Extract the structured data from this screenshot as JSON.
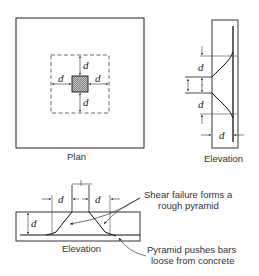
{
  "figure": {
    "plan": {
      "caption": "Plan",
      "dimension_labels": [
        "d",
        "d",
        "d",
        "d"
      ]
    },
    "side_elevation": {
      "caption": "Elevation",
      "dimension_labels": [
        "d",
        "d",
        "d"
      ]
    },
    "bottom_elevation": {
      "caption": "Elevation",
      "dimension_labels": [
        "d",
        "d",
        "d"
      ]
    },
    "annotations": {
      "shear_line1": "Shear failure forms a",
      "shear_line2": "rough pyramid",
      "bars_line1": "Pyramid pushes bars",
      "bars_line2": "loose from concrete"
    },
    "colors": {
      "line": "#222222",
      "hatch": "#888888",
      "background": "#ffffff"
    }
  }
}
